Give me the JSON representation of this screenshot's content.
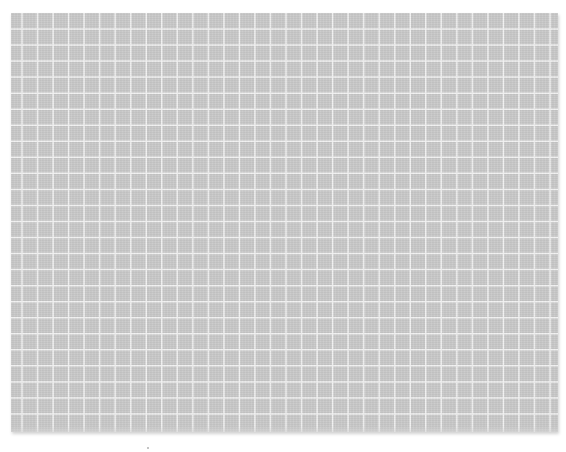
{
  "canvas": {
    "width": 566,
    "height": 452,
    "background": "#ffffff"
  },
  "grid": {
    "fill_color": "#c9c9c9",
    "line_color": "#f2f2f2",
    "left": 11,
    "top": 13,
    "width": 547,
    "height": 419,
    "first_vertical_line_x": 11,
    "first_horizontal_line_y": 16,
    "cell_width": 15.53,
    "cell_height": 16.04,
    "vertical_line_count": 35,
    "horizontal_line_count": 25,
    "line_width": 1.5
  }
}
